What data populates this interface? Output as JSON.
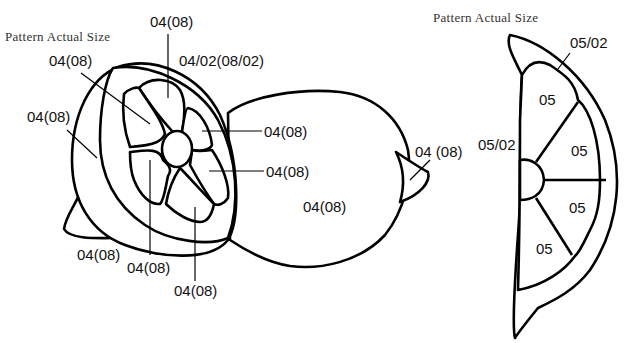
{
  "diagram": {
    "type": "stained-glass pattern",
    "colors": {
      "line": "#000000",
      "fill": "#ffffff",
      "text": "#111111"
    },
    "left_pattern": {
      "title": "Pattern Actual Size",
      "labels": {
        "top_segment": "04(08)",
        "rind_inner": "04/02(08/02)",
        "upper_left_segment": "04(08)",
        "outer_rind": "04(08)",
        "right_upper_segment": "04(08)",
        "right_lower_segment": "04(08)",
        "whole_lemon_body": "04(08)",
        "lemon_tip": "04 (08)",
        "left_tip": "04(08)",
        "lower_left_segment": "04(08)",
        "bottom_segment": "04(08)"
      }
    },
    "right_pattern": {
      "title": "Pattern Actual Size",
      "labels": {
        "rind_top": "05/02",
        "rind_left": "05/02",
        "segment_1": "05",
        "segment_2": "05",
        "segment_3": "05",
        "segment_4": "05"
      }
    }
  }
}
